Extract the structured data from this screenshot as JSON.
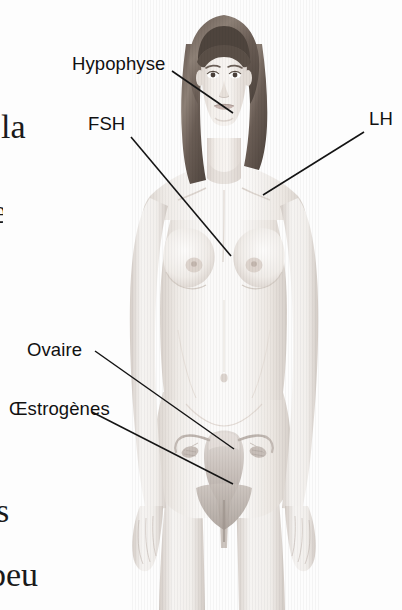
{
  "figure": {
    "kind": "anatomical-illustration",
    "language": "fr",
    "background_color": "#fdfdfd",
    "line_color": "#1a1a1a",
    "label_color": "#111111",
    "skin_light": "#f7f5f3",
    "skin_mid": "#e6e1dd",
    "skin_shadow": "#cfc8c2",
    "hair_dark": "#5b5048",
    "hair_mid": "#8a7d72",
    "organ_tint": "#cfc9c6"
  },
  "labels": {
    "hypophyse": "Hypophyse",
    "fsh": "FSH",
    "lh": "LH",
    "ovaire": "Ovaire",
    "oestrogenes": "Œstrogènes"
  },
  "body_text_fragments": {
    "frag_1": "la",
    "frag_2": "e",
    "frag_3": "s",
    "frag_4": "peu"
  },
  "leader_lines": [
    {
      "name": "hypophyse-leader",
      "x1": 172,
      "y1": 71,
      "x2": 233,
      "y2": 113
    },
    {
      "name": "fsh-leader",
      "x1": 131,
      "y1": 137,
      "x2": 231,
      "y2": 256
    },
    {
      "name": "lh-leader",
      "x1": 364,
      "y1": 132,
      "x2": 263,
      "y2": 195
    },
    {
      "name": "ovaire-leader",
      "x1": 95,
      "y1": 351,
      "x2": 234,
      "y2": 449
    },
    {
      "name": "oestrogenes-leader",
      "x1": 92,
      "y1": 412,
      "x2": 233,
      "y2": 484
    }
  ]
}
